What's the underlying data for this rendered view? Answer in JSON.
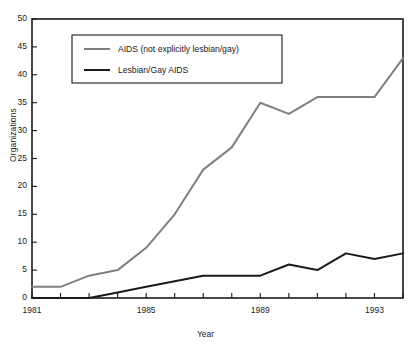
{
  "chart_data": {
    "type": "line",
    "title": "",
    "xlabel": "Year",
    "ylabel": "Organizations",
    "x": [
      1981,
      1982,
      1983,
      1984,
      1985,
      1986,
      1987,
      1988,
      1989,
      1990,
      1991,
      1992,
      1993,
      1994
    ],
    "xlim": [
      1981,
      1994
    ],
    "ylim": [
      0,
      50
    ],
    "ytick_values": [
      0,
      5,
      10,
      15,
      20,
      25,
      30,
      35,
      40,
      45,
      50
    ],
    "ytick_labels": [
      "0",
      "5",
      "10",
      "15",
      "20",
      "25",
      "30",
      "35",
      "40",
      "45",
      "50"
    ],
    "xtick_values": [
      1981,
      1982,
      1983,
      1984,
      1985,
      1986,
      1987,
      1988,
      1989,
      1990,
      1991,
      1992,
      1993,
      1994
    ],
    "xtick_labels": [
      "1981",
      "",
      "",
      "",
      "1985",
      "",
      "",
      "",
      "1989",
      "",
      "",
      "",
      "1993",
      ""
    ],
    "grid": false,
    "legend_position": "upper-left",
    "series": [
      {
        "name": "AIDS (not explicitly lesbian/gay)",
        "color": "#808080",
        "values": [
          2,
          2,
          4,
          5,
          9,
          15,
          23,
          27,
          35,
          33,
          36,
          36,
          36,
          43
        ]
      },
      {
        "name": "Lesbian/Gay AIDS",
        "color": "#1a1a1a",
        "values": [
          0,
          0,
          0,
          1,
          2,
          3,
          4,
          4,
          4,
          6,
          5,
          8,
          7,
          8
        ]
      }
    ]
  },
  "legend": {
    "entries": [
      {
        "label": "AIDS (not explicitly lesbian/gay)"
      },
      {
        "label": "Lesbian/Gay AIDS"
      }
    ]
  },
  "axes": {
    "y_title": "Organizations",
    "x_title": "Year"
  }
}
